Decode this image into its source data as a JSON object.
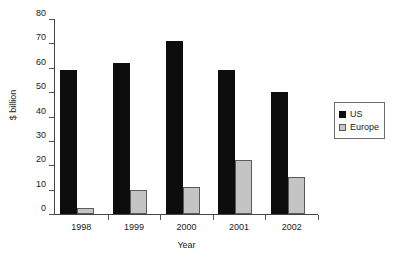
{
  "chart_data": {
    "type": "bar",
    "title": "",
    "subtitle": "",
    "xlabel": "Year",
    "ylabel": "$ billion",
    "categories": [
      "1998",
      "1999",
      "2000",
      "2001",
      "2002"
    ],
    "series": [
      {
        "name": "US",
        "color": "#0d0d0d",
        "values": [
          59,
          62,
          71,
          59,
          50
        ]
      },
      {
        "name": "Europe",
        "color": "#c4c4c4",
        "values": [
          2.5,
          10,
          11,
          22,
          15
        ]
      }
    ],
    "ylim": [
      0,
      80
    ],
    "ytick_values": [
      0,
      10,
      20,
      30,
      40,
      50,
      60,
      70,
      80
    ],
    "ytick_labels": [
      "0",
      "10",
      "20",
      "30",
      "40",
      "50",
      "60",
      "70",
      "80"
    ],
    "grid": false,
    "legend_position": "right",
    "legend_entries": [
      "US",
      "Europe"
    ]
  }
}
